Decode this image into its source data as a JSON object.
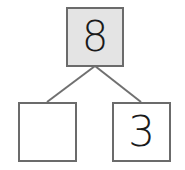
{
  "number_bond": {
    "whole": {
      "value": "8",
      "fill": "#e4e4e4"
    },
    "parts": [
      {
        "value": ""
      },
      {
        "value": "3"
      }
    ],
    "line_color": "#6b6b6b"
  }
}
